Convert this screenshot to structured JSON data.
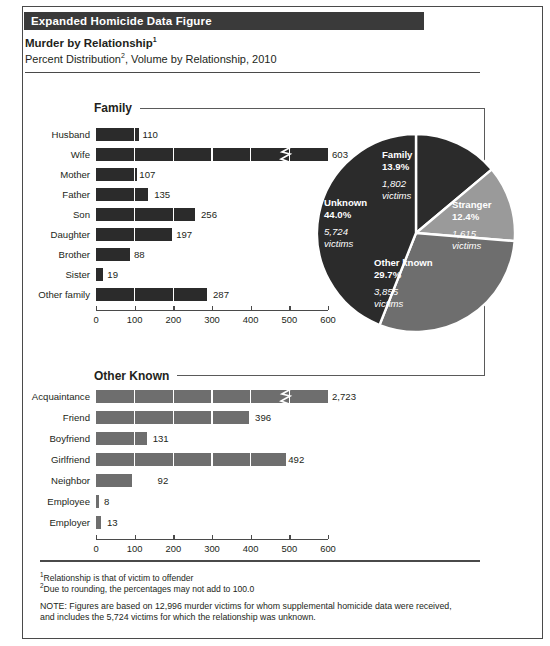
{
  "source_note": "Source: U.S. Department of Justice, Federal Bureau of Investigation, Crime in the United States, 2010: Expanded Homicide Data Figure",
  "header": {
    "band_title": "Expanded Homicide Data Figure",
    "title": "Murder by Relationship",
    "title_sup": "1",
    "subtitle_a": "Percent Distribution",
    "subtitle_sup": "2",
    "subtitle_b": ", Volume by Relationship, 2010"
  },
  "sections": {
    "family_caption": "Family",
    "other_caption": "Other Known"
  },
  "footnotes": {
    "fn1_sup": "1",
    "fn1": "Relationship is that of victim to offender",
    "fn2_sup": "2",
    "fn2": "Due to rounding, the percentages may not add to 100.0",
    "note_line1": "NOTE: Figures are based on 12,996 murder victims for whom supplemental homicide data were received,",
    "note_line2": "and includes the 5,724 victims for which the relationship was unknown."
  },
  "colors": {
    "family": "#2b2b2b",
    "other_known": "#6e6e6e",
    "stranger": "#9a9a9a",
    "unknown": "#2b2b2b",
    "header_band": "#3a3a3a",
    "axis": "#4a4a4a"
  },
  "chart_data": [
    {
      "type": "bar",
      "title": "Family",
      "orientation": "horizontal",
      "categories": [
        "Husband",
        "Wife",
        "Mother",
        "Father",
        "Son",
        "Daughter",
        "Brother",
        "Sister",
        "Other family"
      ],
      "values": [
        110,
        603,
        107,
        135,
        256,
        197,
        88,
        19,
        287
      ],
      "labels": [
        "110",
        "603",
        "107",
        "135",
        "256",
        "197",
        "88",
        "19",
        "287"
      ],
      "xlabel": "",
      "ylabel": "",
      "xlim": [
        0,
        600
      ],
      "xticks": [
        0,
        100,
        200,
        300,
        400,
        500,
        600
      ],
      "xtick_labels": [
        "0",
        "100",
        "200",
        "300",
        "400",
        "500",
        "600"
      ],
      "grid": false,
      "bar_color": "#2b2b2b"
    },
    {
      "type": "bar",
      "title": "Other Known",
      "orientation": "horizontal",
      "categories": [
        "Acquaintance",
        "Friend",
        "Boyfriend",
        "Girlfriend",
        "Neighbor",
        "Employee",
        "Employer"
      ],
      "values": [
        2723,
        396,
        131,
        492,
        92,
        8,
        13
      ],
      "labels": [
        "2,723",
        "396",
        "131",
        "492",
        "92",
        "8",
        "13"
      ],
      "axis_break": {
        "category": "Acquaintance",
        "note": "bar truncated with zigzag break; value exceeds axis maximum"
      },
      "xlabel": "",
      "ylabel": "",
      "xlim": [
        0,
        600
      ],
      "xticks": [
        0,
        100,
        200,
        300,
        400,
        500,
        600
      ],
      "xtick_labels": [
        "0",
        "100",
        "200",
        "300",
        "400",
        "500",
        "600"
      ],
      "grid": false,
      "bar_color": "#6e6e6e"
    },
    {
      "type": "pie",
      "title": "Percent Distribution by Relationship, 2010",
      "slices": [
        {
          "label": "Family",
          "percent": 13.9,
          "victims": "1,802",
          "victims_word": "victims",
          "color": "#2b2b2b"
        },
        {
          "label": "Stranger",
          "percent": 12.4,
          "victims": "1,615",
          "victims_word": "victims",
          "color": "#9a9a9a"
        },
        {
          "label": "Other known",
          "percent": 29.7,
          "victims": "3,855",
          "victims_word": "victims",
          "color": "#6e6e6e"
        },
        {
          "label": "Unknown",
          "percent": 44.0,
          "victims": "5,724",
          "victims_word": "victims",
          "color": "#2b2b2b"
        }
      ],
      "total_victims": 12996,
      "legend": "in-slice labels"
    }
  ]
}
